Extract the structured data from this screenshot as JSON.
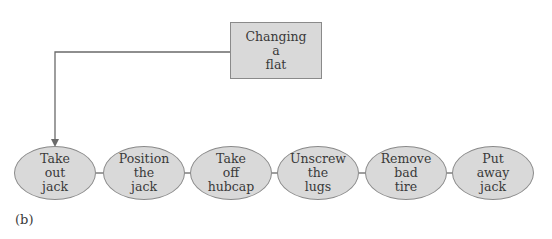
{
  "root": {
    "lines": [
      "Changing",
      "a",
      "flat"
    ]
  },
  "steps": [
    {
      "lines": [
        "Take",
        "out",
        "jack"
      ]
    },
    {
      "lines": [
        "Position",
        "the",
        "jack"
      ]
    },
    {
      "lines": [
        "Take",
        "off",
        "hubcap"
      ]
    },
    {
      "lines": [
        "Unscrew",
        "the",
        "lugs"
      ]
    },
    {
      "lines": [
        "Remove",
        "bad",
        "tire"
      ]
    },
    {
      "lines": [
        "Put",
        "away",
        "jack"
      ]
    }
  ],
  "caption": "(b)",
  "colors": {
    "fill": "#d9d9d9",
    "stroke": "#8a8a8a",
    "line": "#6a6a6a"
  }
}
